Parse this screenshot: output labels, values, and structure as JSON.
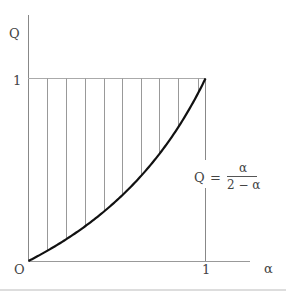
{
  "diagram": {
    "y_axis_label": "Q",
    "x_axis_label": "α",
    "origin_label": "O",
    "y_tick_label": "1",
    "x_tick_label": "1",
    "formula": {
      "lhs": "Q",
      "eq": "=",
      "numerator": "α",
      "denominator": "2 − α"
    },
    "hatch_alphas": [
      0.107,
      0.214,
      0.322,
      0.424,
      0.531,
      0.638,
      0.74,
      0.847,
      0.955
    ],
    "colors": {
      "curve": "#111111",
      "lines": "#888888",
      "text": "#444444",
      "rule": "#cccccc"
    }
  }
}
